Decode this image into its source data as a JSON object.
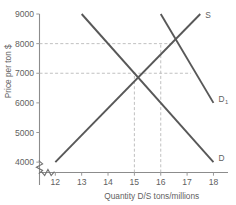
{
  "chart_data": {
    "type": "line",
    "title": "",
    "xlabel": "Quantity D/S tons/millions",
    "ylabel": "Price per ton $",
    "xlim": [
      11.4,
      18.4
    ],
    "ylim": [
      3650,
      9000
    ],
    "xticks": [
      "12",
      "13",
      "14",
      "15",
      "16",
      "17",
      "18"
    ],
    "yticks": [
      "4000",
      "5000",
      "6000",
      "7000",
      "8000",
      "9000"
    ],
    "grid": false,
    "axis_break_x": true,
    "axis_break_y": true,
    "legend_position": "inline-end-of-line",
    "series": [
      {
        "name": "S",
        "label": "S",
        "role": "supply",
        "points": [
          [
            12,
            4000
          ],
          [
            17.5,
            9000
          ]
        ]
      },
      {
        "name": "D",
        "label": "D",
        "role": "demand-original",
        "points": [
          [
            13,
            9000
          ],
          [
            18,
            4000
          ]
        ]
      },
      {
        "name": "D1",
        "label": "D",
        "label_sub": "1",
        "role": "demand-shifted",
        "points": [
          [
            16,
            9000
          ],
          [
            18,
            6000
          ]
        ]
      }
    ],
    "equilibria": [
      {
        "name": "equilibrium-original",
        "quantity": 15,
        "price": 7000
      },
      {
        "name": "equilibrium-shifted",
        "quantity": 16,
        "price": 8000
      }
    ],
    "guide_lines": [
      {
        "name": "guide-price-7000",
        "orientation": "horizontal",
        "value": 7000
      },
      {
        "name": "guide-price-8000",
        "orientation": "horizontal",
        "value": 8000
      },
      {
        "name": "guide-quantity-15",
        "orientation": "vertical",
        "value": 15
      },
      {
        "name": "guide-quantity-16",
        "orientation": "vertical",
        "value": 16
      }
    ],
    "colors": {
      "curve": "#585858",
      "axis": "#8c8c8c",
      "guide": "#b9b9b9",
      "text": "#5f5f5f",
      "background": "#ffffff"
    }
  }
}
